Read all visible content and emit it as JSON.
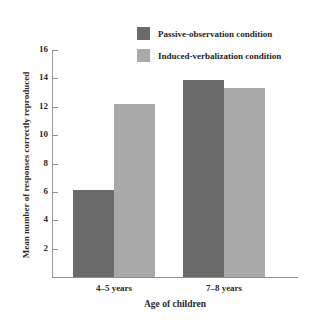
{
  "chart_data": {
    "type": "bar",
    "title": "",
    "xlabel": "Age of children",
    "ylabel": "Mean number of responses correctly reproduced",
    "categories": [
      "4–5 years",
      "7–8 years"
    ],
    "series": [
      {
        "name": "Passive-observation condition",
        "color": "#6b6b6b",
        "values": [
          6.1,
          13.9
        ]
      },
      {
        "name": "Induced-verbalization condition",
        "color": "#a9a9a9",
        "values": [
          12.2,
          13.3
        ]
      }
    ],
    "ylim": [
      0,
      16
    ],
    "yticks": [
      2,
      4,
      6,
      8,
      10,
      12,
      14,
      16
    ],
    "ytick_labels": [
      "2",
      "4",
      "6",
      "8",
      "10",
      "12",
      "14",
      "16"
    ],
    "grid": false,
    "legend_position": "top-center"
  },
  "legend": {
    "items": [
      {
        "label": "Passive-observation condition",
        "color": "#6b6b6b"
      },
      {
        "label": "Induced-verbalization condition",
        "color": "#a9a9a9"
      }
    ]
  },
  "axes": {
    "x_title": "Age of children",
    "y_title": "Mean number of responses correctly reproduced",
    "group_labels": [
      "4–5 years",
      "7–8 years"
    ]
  }
}
